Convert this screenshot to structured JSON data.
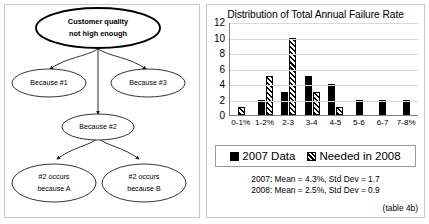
{
  "diagram": {
    "root": {
      "label_line1": "Customer quality",
      "label_line2": "not high enough"
    },
    "level2": [
      {
        "label": "Because #1"
      },
      {
        "label": "Because #3"
      }
    ],
    "level2_center": {
      "label": "Because #2"
    },
    "level3": [
      {
        "label_line1": "#2 occurs",
        "label_line2": "because A"
      },
      {
        "label_line1": "#2 occurs",
        "label_line2": "because B"
      }
    ]
  },
  "chart_data": {
    "type": "bar",
    "title": "Distribution of Total Annual Failure Rate",
    "xlabel": "",
    "ylabel": "",
    "ylim": [
      0,
      12
    ],
    "yticks": [
      12,
      10,
      8,
      6,
      4,
      2,
      0
    ],
    "grid": true,
    "legend_position": "below",
    "categories": [
      "0-1%",
      "1-2%",
      "2-3",
      "3-4",
      "4-5",
      "5-6",
      "6-7",
      "7-8%"
    ],
    "series": [
      {
        "name": "2007 Data",
        "values": [
          0,
          2,
          3,
          5,
          4,
          2,
          2,
          2
        ],
        "style": "solid",
        "color": "#000000"
      },
      {
        "name": "Needed in 2008",
        "values": [
          1,
          5,
          10,
          3,
          1,
          0,
          0,
          0
        ],
        "style": "hatch",
        "color": "#000000"
      }
    ],
    "annotations": [
      "2007: Mean = 4.3%, Std Dev = 1.7",
      "2008: Mean = 2.5%, Std Dev = 0.9"
    ]
  },
  "caption": "(table 4b)"
}
